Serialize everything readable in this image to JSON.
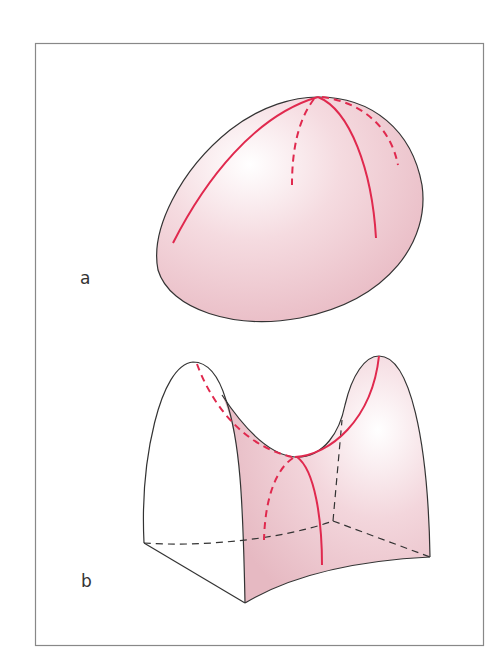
{
  "figure": {
    "panels": [
      {
        "label": "a",
        "shape": "ellipsoid (positive curvature)",
        "description": "Egg-shaped convex surface with red meridian curves"
      },
      {
        "label": "b",
        "shape": "saddle / hyperbolic paraboloid (negative curvature)",
        "description": "Saddle surface with red principal curves crossing at saddle point"
      }
    ],
    "colors": {
      "surface_fill": "#f2d3d9",
      "surface_highlight": "#ffffff",
      "curve": "#e0294e",
      "outline": "#333333",
      "frame": "#888888"
    }
  }
}
